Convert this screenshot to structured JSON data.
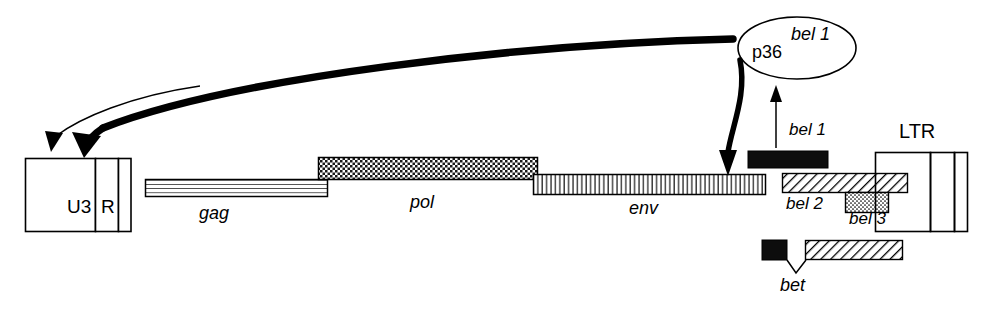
{
  "figure": {
    "type": "genome-map-diagram",
    "background_color": "#ffffff",
    "stroke_color": "#000000"
  },
  "ltr_left": {
    "u3_label": "U3",
    "r_label": "R",
    "u5_label": ""
  },
  "ltr_right": {
    "label": "LTR"
  },
  "genes": [
    {
      "name": "gag",
      "label": "gag",
      "fill": "horizontal-lines"
    },
    {
      "name": "pol",
      "label": "pol",
      "fill": "checkerboard"
    },
    {
      "name": "env",
      "label": "env",
      "fill": "vertical-lines"
    }
  ],
  "orfs": [
    {
      "name": "bel-1",
      "label": "bel 1",
      "fill": "solid-black"
    },
    {
      "name": "bel-2",
      "label": "bel 2",
      "fill": "diagonal-hatch"
    },
    {
      "name": "bel-3",
      "label": "bel 3",
      "fill": "stipple-dots"
    }
  ],
  "spliced_product": {
    "label": "bet",
    "exon1_fill": "solid-black",
    "exon2_fill": "diagonal-hatch"
  },
  "protein": {
    "name_left": "p36",
    "name_right": "bel 1",
    "shape": "ellipse"
  },
  "arrows": {
    "transactivation_thick": "curved-arrow-to-u3",
    "transactivation_thin": "thin-curved-arrow-to-u3",
    "expression_down": "curved-arrow-down-to-genome",
    "translation_up": "straight-arrow-up-from-bel1"
  }
}
